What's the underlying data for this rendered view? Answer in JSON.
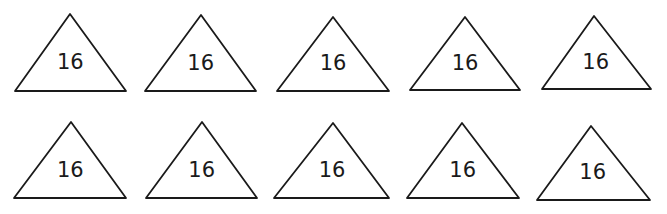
{
  "diagram": {
    "stroke_color": "#1a1a1a",
    "background_color": "#ffffff",
    "rows": [
      {
        "triangles": [
          {
            "label": "16",
            "apex": [
              70,
              14
            ],
            "base_left": [
              15,
              91
            ],
            "base_right": [
              126,
              91
            ]
          },
          {
            "label": "16",
            "apex": [
              201,
              15
            ],
            "base_left": [
              145,
              91
            ],
            "base_right": [
              256,
              91
            ]
          },
          {
            "label": "16",
            "apex": [
              333,
              17
            ],
            "base_left": [
              277,
              91
            ],
            "base_right": [
              389,
              91
            ]
          },
          {
            "label": "16",
            "apex": [
              465,
              17
            ],
            "base_left": [
              410,
              90
            ],
            "base_right": [
              520,
              90
            ]
          },
          {
            "label": "16",
            "apex": [
              594,
              16
            ],
            "base_left": [
              542,
              89
            ],
            "base_right": [
              651,
              89
            ]
          }
        ]
      },
      {
        "triangles": [
          {
            "label": "16",
            "apex": [
              71,
              122
            ],
            "base_left": [
              14,
              198
            ],
            "base_right": [
              126,
              198
            ]
          },
          {
            "label": "16",
            "apex": [
              202,
              122
            ],
            "base_left": [
              146,
              198
            ],
            "base_right": [
              257,
              198
            ]
          },
          {
            "label": "16",
            "apex": [
              333,
              123
            ],
            "base_left": [
              274,
              198
            ],
            "base_right": [
              389,
              198
            ]
          },
          {
            "label": "16",
            "apex": [
              462,
              123
            ],
            "base_left": [
              407,
              198
            ],
            "base_right": [
              519,
              198
            ]
          },
          {
            "label": "16",
            "apex": [
              591,
              126
            ],
            "base_left": [
              537,
              200
            ],
            "base_right": [
              650,
              200
            ]
          }
        ]
      }
    ]
  }
}
